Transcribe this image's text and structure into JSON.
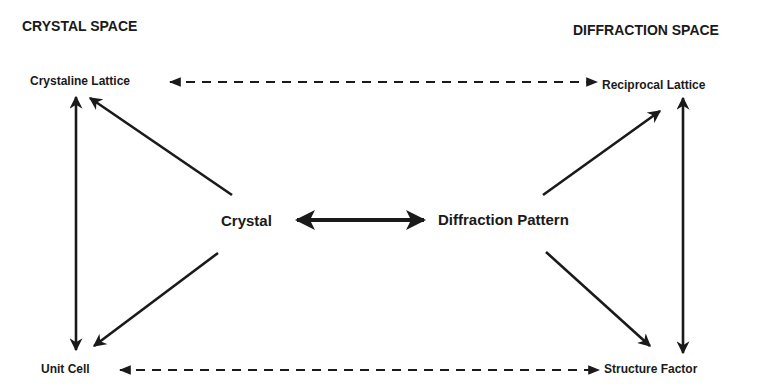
{
  "headers": {
    "left": "CRYSTAL SPACE",
    "right": "DIFFRACTION SPACE"
  },
  "nodes": {
    "crystaline_lattice": "Crystaline Lattice",
    "reciprocal_lattice": "Reciprocal Lattice",
    "crystal": "Crystal",
    "diffraction_pattern": "Diffraction Pattern",
    "unit_cell": "Unit  Cell",
    "structure_factor": "Structure Factor"
  },
  "edges": [
    {
      "from": "crystaline_lattice",
      "to": "reciprocal_lattice",
      "style": "dashed",
      "direction": "both"
    },
    {
      "from": "unit_cell",
      "to": "structure_factor",
      "style": "dashed",
      "direction": "both"
    },
    {
      "from": "crystal",
      "to": "diffraction_pattern",
      "style": "solid-thick",
      "direction": "both"
    },
    {
      "from": "crystaline_lattice",
      "to": "unit_cell",
      "style": "solid",
      "direction": "both"
    },
    {
      "from": "reciprocal_lattice",
      "to": "structure_factor",
      "style": "solid",
      "direction": "both"
    },
    {
      "from": "crystal",
      "to": "crystaline_lattice",
      "style": "solid",
      "direction": "forward"
    },
    {
      "from": "crystal",
      "to": "unit_cell",
      "style": "solid",
      "direction": "forward"
    },
    {
      "from": "diffraction_pattern",
      "to": "reciprocal_lattice",
      "style": "solid",
      "direction": "forward"
    },
    {
      "from": "diffraction_pattern",
      "to": "structure_factor",
      "style": "solid",
      "direction": "forward"
    }
  ],
  "colors": {
    "ink": "#1a1a1a",
    "background": "#ffffff"
  }
}
